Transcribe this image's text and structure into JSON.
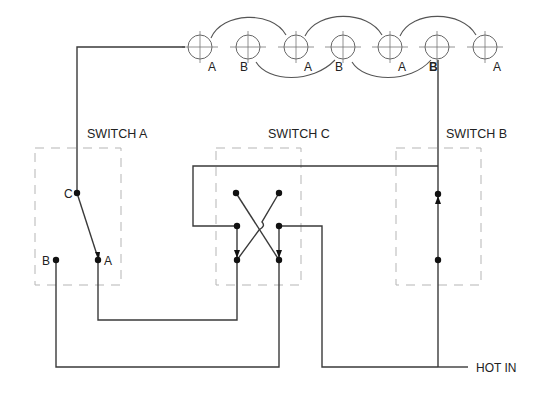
{
  "diagram": {
    "type": "four-way switch wiring diagram",
    "switches": [
      {
        "id": "a",
        "title": "SWITCH A",
        "terminals": [
          "C",
          "B",
          "A"
        ]
      },
      {
        "id": "c",
        "title": "SWITCH C"
      },
      {
        "id": "b",
        "title": "SWITCH B"
      }
    ],
    "lights": [
      {
        "label": "A"
      },
      {
        "label": "B"
      },
      {
        "label": "A"
      },
      {
        "label": "B"
      },
      {
        "label": "A"
      },
      {
        "label": "B"
      },
      {
        "label": "A"
      }
    ],
    "hot_in_label": "HOT IN"
  }
}
